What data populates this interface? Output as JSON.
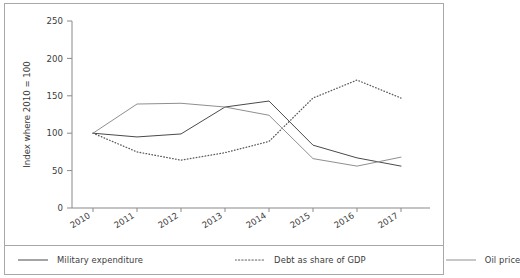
{
  "chart_data": {
    "type": "line",
    "title": "",
    "xlabel": "",
    "ylabel": "Index where 2010 = 100",
    "x": [
      "2010",
      "2011",
      "2012",
      "2013",
      "2014",
      "2015",
      "2016",
      "2017"
    ],
    "categories": [
      "2010",
      "2011",
      "2012",
      "2013",
      "2014",
      "2015",
      "2016",
      "2017"
    ],
    "ylim": [
      0,
      250
    ],
    "yticks": [
      0,
      50,
      100,
      150,
      200,
      250
    ],
    "ytick_labels": [
      "0",
      "50",
      "100",
      "150",
      "200",
      "250"
    ],
    "grid": false,
    "legend_position": "bottom",
    "series": [
      {
        "name": "Military expenditure",
        "style": "solid",
        "color": "#4a4a4a",
        "values": [
          100,
          95,
          99,
          135,
          143,
          84,
          67,
          56
        ]
      },
      {
        "name": "Debt as share of GDP",
        "style": "dotted",
        "color": "#5c5c5c",
        "values": [
          100,
          75,
          64,
          74,
          89,
          147,
          171,
          147
        ]
      },
      {
        "name": "Oil price",
        "style": "solid",
        "color": "#8f8f8f",
        "values": [
          100,
          139,
          140,
          135,
          124,
          66,
          56,
          68
        ]
      }
    ]
  },
  "axes": {
    "y_label": "Index where 2010 = 100"
  },
  "legend": {
    "items": [
      {
        "label": "Military expenditure"
      },
      {
        "label": "Debt as share of GDP"
      },
      {
        "label": "Oil price"
      }
    ]
  },
  "colors": {
    "frame": "#a8a8a8",
    "axis": "#8a8a8a",
    "text": "#3b3b3b",
    "military": "#4a4a4a",
    "debt": "#5c5c5c",
    "oil": "#8f8f8f",
    "background": "#ffffff"
  }
}
